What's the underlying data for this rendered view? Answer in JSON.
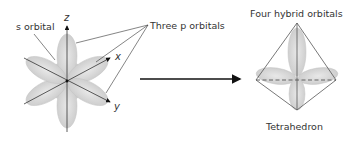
{
  "diagram": {
    "left": {
      "s_label": "s orbital",
      "p_label": "Three p orbitals",
      "axes": {
        "z": "z",
        "x": "x",
        "y": "y"
      }
    },
    "right": {
      "top_label": "Four hybrid orbitals",
      "bottom_label": "Tetrahedron"
    },
    "colors": {
      "lobe_fill": "#d4d4d4",
      "lobe_edge": "#bdbdbd",
      "line": "#333333",
      "arrow": "#111111",
      "dashed": "#555555"
    }
  }
}
